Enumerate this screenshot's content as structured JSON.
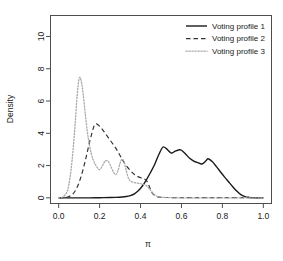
{
  "chart_data": {
    "type": "line",
    "title": "",
    "xlabel": "π",
    "ylabel": "Density",
    "xlim": [
      -0.04,
      1.04
    ],
    "ylim": [
      -0.35,
      11.3
    ],
    "xticks": [
      0.0,
      0.2,
      0.4,
      0.6,
      0.8,
      1.0
    ],
    "xticklabels": [
      "0.0",
      "0.2",
      "0.4",
      "0.6",
      "0.8",
      "1.0"
    ],
    "yticks": [
      0,
      2,
      4,
      6,
      8,
      10
    ],
    "yticklabels": [
      "0",
      "2",
      "4",
      "6",
      "8",
      "10"
    ],
    "grid": false,
    "legend_position": "top-right",
    "frame": true,
    "series": [
      {
        "name": "Voting profile 1",
        "style": "solid",
        "color": "#1a1a1a",
        "width": 1.4,
        "x": [
          0.0,
          0.05,
          0.1,
          0.15,
          0.2,
          0.25,
          0.28,
          0.31,
          0.33,
          0.35,
          0.37,
          0.39,
          0.41,
          0.43,
          0.45,
          0.47,
          0.49,
          0.51,
          0.53,
          0.55,
          0.57,
          0.59,
          0.6,
          0.62,
          0.64,
          0.66,
          0.68,
          0.7,
          0.72,
          0.73,
          0.75,
          0.77,
          0.79,
          0.81,
          0.83,
          0.85,
          0.87,
          0.89,
          0.91,
          0.93,
          0.95,
          1.0
        ],
        "y": [
          0.0,
          0.0,
          0.0,
          0.0,
          0.01,
          0.02,
          0.03,
          0.05,
          0.08,
          0.14,
          0.25,
          0.45,
          0.75,
          1.15,
          1.6,
          2.1,
          2.7,
          3.15,
          3.0,
          2.78,
          2.9,
          2.98,
          2.95,
          2.72,
          2.45,
          2.28,
          2.18,
          2.1,
          2.3,
          2.42,
          2.25,
          1.95,
          1.62,
          1.3,
          1.0,
          0.7,
          0.42,
          0.2,
          0.08,
          0.03,
          0.01,
          0.0
        ]
      },
      {
        "name": "Voting profile 2",
        "style": "dashed",
        "color": "#333333",
        "width": 1.2,
        "x": [
          0.0,
          0.03,
          0.05,
          0.07,
          0.09,
          0.11,
          0.13,
          0.15,
          0.17,
          0.18,
          0.19,
          0.21,
          0.23,
          0.25,
          0.27,
          0.29,
          0.31,
          0.33,
          0.35,
          0.37,
          0.39,
          0.41,
          0.42,
          0.43,
          0.44,
          0.45,
          0.46,
          0.48,
          0.5,
          0.55,
          0.6,
          0.7,
          0.8,
          0.9,
          1.0
        ],
        "y": [
          0.0,
          0.02,
          0.08,
          0.25,
          0.65,
          1.35,
          2.3,
          3.4,
          4.35,
          4.58,
          4.55,
          4.3,
          3.95,
          3.6,
          3.25,
          2.85,
          2.4,
          2.0,
          1.7,
          1.45,
          1.3,
          1.2,
          1.15,
          1.05,
          0.8,
          0.48,
          0.25,
          0.08,
          0.03,
          0.02,
          0.02,
          0.02,
          0.02,
          0.02,
          0.02
        ]
      },
      {
        "name": "Voting profile 3",
        "style": "dotted",
        "color": "#a8a8a8",
        "width": 1.3,
        "x": [
          0.0,
          0.02,
          0.04,
          0.05,
          0.06,
          0.07,
          0.08,
          0.09,
          0.1,
          0.11,
          0.12,
          0.13,
          0.14,
          0.15,
          0.16,
          0.17,
          0.18,
          0.19,
          0.2,
          0.21,
          0.22,
          0.23,
          0.24,
          0.25,
          0.26,
          0.27,
          0.28,
          0.29,
          0.3,
          0.31,
          0.32,
          0.33,
          0.34,
          0.35,
          0.37,
          0.39,
          0.41,
          0.43,
          0.45,
          0.47,
          0.5,
          0.6,
          0.8,
          1.0
        ],
        "y": [
          0.0,
          0.05,
          0.35,
          0.85,
          1.7,
          2.95,
          4.5,
          6.3,
          7.4,
          7.25,
          6.4,
          5.2,
          4.1,
          3.3,
          2.7,
          2.3,
          2.05,
          1.85,
          1.75,
          1.9,
          2.15,
          2.3,
          2.28,
          2.1,
          1.8,
          1.55,
          1.45,
          1.7,
          2.15,
          2.4,
          2.2,
          1.7,
          1.25,
          1.05,
          0.95,
          0.9,
          0.85,
          0.75,
          0.45,
          0.18,
          0.04,
          0.0,
          0.0,
          0.0
        ]
      }
    ]
  },
  "legend": {
    "items": [
      {
        "label": "Voting profile 1"
      },
      {
        "label": "Voting profile 2"
      },
      {
        "label": "Voting profile 3"
      }
    ]
  }
}
